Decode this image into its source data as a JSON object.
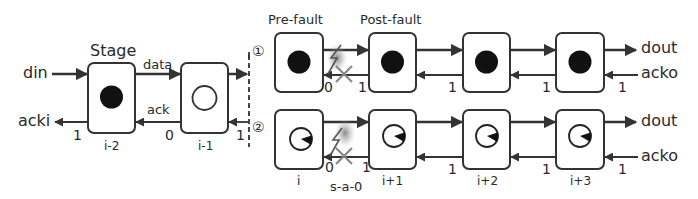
{
  "colors": {
    "stroke": "#333333",
    "token_fill": "#111111",
    "fault_glow": "#8a8a8a"
  },
  "left": {
    "title": "Stage",
    "input_data": "din",
    "output_ack": "acki",
    "data_label": "data",
    "ack_label": "ack",
    "stages": [
      {
        "id": "i-2",
        "token": "full",
        "ack_value": "1"
      },
      {
        "id": "i-1",
        "token": "empty",
        "ack_value": "0"
      }
    ],
    "boundary_ack_value": "1"
  },
  "scenarios": [
    {
      "marker": "①",
      "header_labels": [
        "Pre-fault",
        "Post-fault"
      ],
      "stages": [
        {
          "id": "",
          "token": "full"
        },
        {
          "id": "",
          "token": "full"
        },
        {
          "id": "",
          "token": "full"
        },
        {
          "id": "",
          "token": "full"
        }
      ],
      "ack_values": [
        "0",
        "1",
        "1",
        "1",
        "1"
      ],
      "output_data": "dout",
      "input_ack": "acko",
      "fault_between": [
        0,
        1
      ]
    },
    {
      "marker": "②",
      "stages": [
        {
          "id": "i",
          "token": "partial"
        },
        {
          "id": "i+1",
          "token": "partial"
        },
        {
          "id": "i+2",
          "token": "partial"
        },
        {
          "id": "i+3",
          "token": "partial"
        }
      ],
      "ack_values": [
        "0",
        "1",
        "1",
        "1",
        "1"
      ],
      "output_data": "dout",
      "input_ack": "acko",
      "fault_label": "s-a-0",
      "fault_between": [
        0,
        1
      ]
    }
  ]
}
